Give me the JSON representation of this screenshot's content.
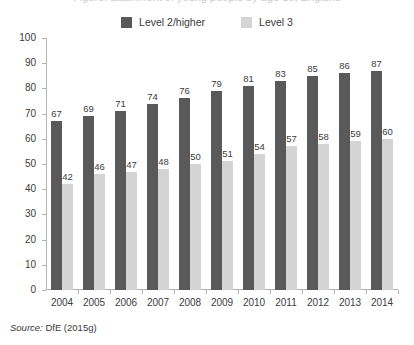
{
  "title_remnant": "Figure: attainment of young people by age 19, England",
  "legend": {
    "position": "top-center",
    "entries": [
      {
        "label": "Level 2/higher",
        "color": "#595959",
        "swatch": "legend-swatch-dark"
      },
      {
        "label": "Level 3",
        "color": "#d4d4d4",
        "swatch": "legend-swatch-light"
      }
    ]
  },
  "source": {
    "prefix": "Source:",
    "text": "DfE (2015g)"
  },
  "axes": {
    "y_ticks": [
      "100",
      "90",
      "80",
      "70",
      "60",
      "50",
      "40",
      "30",
      "20",
      "10",
      "0"
    ]
  },
  "chart_data": {
    "type": "bar",
    "title": "",
    "xlabel": "",
    "ylabel": "",
    "ylim": [
      0,
      100
    ],
    "ytick_step": 10,
    "grid": false,
    "legend_position": "top-center",
    "categories": [
      "2004",
      "2005",
      "2006",
      "2007",
      "2008",
      "2009",
      "2010",
      "2011",
      "2012",
      "2013",
      "2014"
    ],
    "series": [
      {
        "name": "Level 2/higher",
        "color": "#595959",
        "values": [
          67,
          69,
          71,
          74,
          76,
          79,
          81,
          83,
          85,
          86,
          87
        ]
      },
      {
        "name": "Level 3",
        "color": "#d4d4d4",
        "values": [
          42,
          46,
          47,
          48,
          50,
          51,
          54,
          57,
          58,
          59,
          60
        ]
      }
    ]
  }
}
